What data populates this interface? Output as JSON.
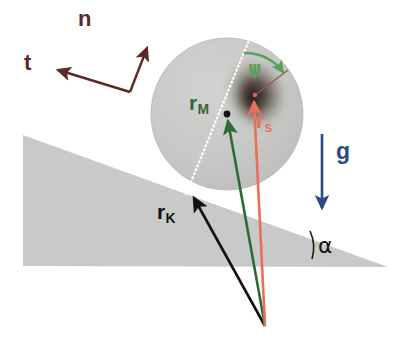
{
  "figure": {
    "background_color": "#ffffff",
    "width": 404,
    "height": 342
  },
  "labels": {
    "normal_vector": "n",
    "tangent_vector": "t",
    "gravity_vector": "g",
    "mass_center_vector": "r",
    "mass_center_vector_sub": "M",
    "body_center_vector": "r",
    "body_center_vector_sub": "s",
    "contact_point_vector": "r",
    "contact_point_vector_sub": "K",
    "rotation_angle": "ψ",
    "incline_angle": "α"
  },
  "colors": {
    "normal_tangent": "#5a2a24",
    "gravity": "#2e4a86",
    "mass_center": "#2f6b38",
    "body_center": "#e8705a",
    "contact_point": "#111111",
    "rotation_angle_arc": "#5aa05a",
    "incline_fill": "#c9cac7",
    "disk_fill": "#c6c7c4",
    "disk_dotted_line": "#ffffff",
    "mass_blob": "#3a2f28"
  },
  "geometry": {
    "disk": {
      "cx": 227,
      "cy": 114,
      "r": 76
    },
    "mass_blob": {
      "cx": 256,
      "cy": 94,
      "rx": 34,
      "ry": 40
    },
    "geometric_center_dot": {
      "x": 227,
      "y": 114
    },
    "contact_point": {
      "x": 190,
      "y": 192
    },
    "origin": {
      "x": 265,
      "y": 326
    },
    "incline": {
      "apex": {
        "x": 23,
        "y": 135
      },
      "bottom_left": {
        "x": 23,
        "y": 266
      },
      "right_tip": {
        "x": 388,
        "y": 267
      }
    },
    "frame_corner": {
      "x": 130,
      "y": 92
    },
    "normal_tip": {
      "x": 149,
      "y": 41
    },
    "tangent_tip": {
      "x": 51,
      "y": 71
    },
    "gravity_arrow": {
      "x": 322,
      "y_start": 134,
      "y_end": 216
    }
  }
}
